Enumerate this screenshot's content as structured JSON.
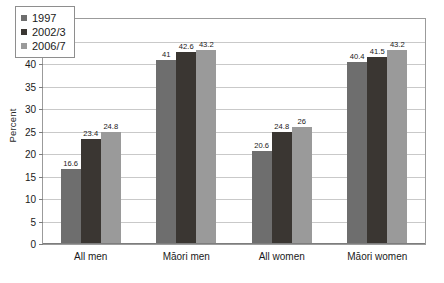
{
  "chart_data": {
    "type": "bar",
    "title": "",
    "subtitle": "",
    "xlabel": "",
    "ylabel": "Percent",
    "ylim": [
      0,
      50
    ],
    "ytick_step": 5,
    "yticks": [
      50,
      45,
      40,
      35,
      30,
      25,
      20,
      15,
      10,
      5,
      0
    ],
    "grid": true,
    "legend_position": "top-left",
    "categories": [
      "All men",
      "Māori men",
      "All women",
      "Māori women"
    ],
    "series": [
      {
        "name": "1997",
        "color": "#6e6e6e",
        "values": [
          16.6,
          41,
          20.6,
          40.4
        ],
        "labels": [
          "16.6",
          "41",
          "20.6",
          "40.4"
        ]
      },
      {
        "name": "2002/3",
        "color": "#3a3632",
        "values": [
          23.4,
          42.6,
          24.8,
          41.5
        ],
        "labels": [
          "23.4",
          "42.6",
          "24.8",
          "41.5"
        ]
      },
      {
        "name": "2006/7",
        "color": "#9a9a9a",
        "values": [
          24.8,
          43.2,
          26,
          43.2
        ],
        "labels": [
          "24.8",
          "43.2",
          "26",
          "43.2"
        ]
      }
    ]
  },
  "legend": {
    "entries": [
      {
        "label": "1997",
        "color": "#6e6e6e"
      },
      {
        "label": "2002/3",
        "color": "#3a3632"
      },
      {
        "label": "2006/7",
        "color": "#9a9a9a"
      }
    ]
  },
  "axis": {
    "y_title": "Percent"
  },
  "colors": {
    "grid": "#c9c9c9",
    "frame": "#9b9b9b",
    "text": "#1a1a1a",
    "background": "#ffffff"
  }
}
